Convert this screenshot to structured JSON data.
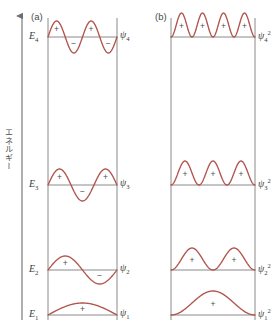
{
  "figure": {
    "axis_label": "エネルギー",
    "axis_direction": "up",
    "panels": [
      {
        "tag": "(a)",
        "quantity": "wavefunction"
      },
      {
        "tag": "(b)",
        "quantity": "probability-density"
      }
    ],
    "energy_levels": [
      {
        "name": "E4",
        "label": "E",
        "sub": "4",
        "y": 37
      },
      {
        "name": "E3",
        "label": "E",
        "sub": "3",
        "y": 185
      },
      {
        "name": "E2",
        "label": "E",
        "sub": "2",
        "y": 270
      },
      {
        "name": "E1",
        "label": "E",
        "sub": "1",
        "y": 315
      }
    ],
    "wave_labels_a": [
      {
        "glyph": "ψ",
        "sub": "4",
        "sup": ""
      },
      {
        "glyph": "ψ",
        "sub": "3",
        "sup": ""
      },
      {
        "glyph": "ψ",
        "sub": "2",
        "sup": ""
      },
      {
        "glyph": "ψ",
        "sub": "1",
        "sup": ""
      }
    ],
    "wave_labels_b": [
      {
        "glyph": "ψ",
        "sub": "4",
        "sup": "2"
      },
      {
        "glyph": "ψ",
        "sub": "3",
        "sup": "2"
      },
      {
        "glyph": "ψ",
        "sub": "2",
        "sup": "2"
      },
      {
        "glyph": "ψ",
        "sub": "1",
        "sup": "2"
      }
    ],
    "sign_plus": "+",
    "sign_minus": "−",
    "colors": {
      "wave": "#b0544c",
      "baseline": "#8a8a8a",
      "wall": "#8a8a8a",
      "axis": "#6e6e6e",
      "text": "#3b3b3b"
    }
  },
  "chart_data": {
    "type": "line",
    "title": "",
    "xlabel": "",
    "ylabel": "エネルギー",
    "panel_a": {
      "description": "particle-in-a-box wavefunctions psi_n",
      "series": [
        {
          "name": "ψ₄",
          "n": 4,
          "baseline_y": 37,
          "amplitude": 16,
          "nodes_interior": 3,
          "signs": [
            "+",
            "−",
            "+",
            "−"
          ]
        },
        {
          "name": "ψ₃",
          "n": 3,
          "baseline_y": 185,
          "amplitude": 16,
          "nodes_interior": 2,
          "signs": [
            "+",
            "−",
            "+"
          ]
        },
        {
          "name": "ψ₂",
          "n": 2,
          "baseline_y": 270,
          "amplitude": 14,
          "nodes_interior": 1,
          "signs": [
            "+",
            "−"
          ]
        },
        {
          "name": "ψ₁",
          "n": 1,
          "baseline_y": 315,
          "amplitude": 12,
          "nodes_interior": 0,
          "signs": [
            "+"
          ]
        }
      ]
    },
    "panel_b": {
      "description": "probability densities psi_n squared (all positive lobes)",
      "series": [
        {
          "name": "ψ₄²",
          "n": 4,
          "baseline_y": 37,
          "amplitude": 24,
          "lobes": 4,
          "signs": [
            "+",
            "+",
            "+",
            "+"
          ]
        },
        {
          "name": "ψ₃²",
          "n": 3,
          "baseline_y": 185,
          "amplitude": 24,
          "lobes": 3,
          "signs": [
            "+",
            "+",
            "+"
          ]
        },
        {
          "name": "ψ₂²",
          "n": 2,
          "baseline_y": 270,
          "amplitude": 22,
          "lobes": 2,
          "signs": [
            "+",
            "+"
          ]
        },
        {
          "name": "ψ₁²",
          "n": 1,
          "baseline_y": 315,
          "amplitude": 24,
          "lobes": 1,
          "signs": [
            "+"
          ]
        }
      ]
    },
    "box_a": {
      "left": 48,
      "right": 117,
      "top": 18,
      "bottom": 320
    },
    "box_b": {
      "left": 171,
      "right": 255,
      "top": 18,
      "bottom": 320
    },
    "grid": false,
    "legend": "none"
  }
}
